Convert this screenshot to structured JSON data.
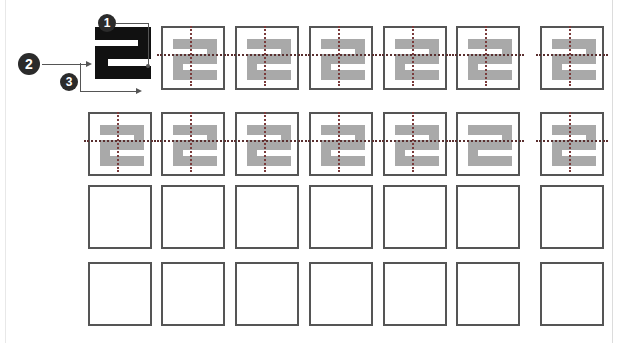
{
  "page": {
    "background_color": "#ffffff",
    "width": 624,
    "height": 343,
    "margin_rule_color": "#e8e8e8"
  },
  "style": {
    "cell_border_color": "#555555",
    "cell_border_width": 2,
    "cell_size": 64,
    "shape_grey": "#a9a9a9",
    "shape_black": "#111111",
    "axis_color": "#7a3b3b",
    "callout_fill": "#2b2b2b",
    "callout_text": "#ffffff",
    "leader_color": "#555555"
  },
  "callouts": [
    {
      "id": "callout-1",
      "label": "1",
      "x": 98,
      "y": 14,
      "diameter": 18,
      "target": "top-right of reference glyph"
    },
    {
      "id": "callout-2",
      "label": "2",
      "x": 18,
      "y": 53,
      "diameter": 22,
      "target": "left side of reference glyph"
    },
    {
      "id": "callout-3",
      "label": "3",
      "x": 60,
      "y": 73,
      "diameter": 18,
      "target": "bottom of reference glyph"
    }
  ],
  "reference_glyph": {
    "name": "reference-digit-2",
    "color": "#111111",
    "rotation_deg": 180,
    "x": 95,
    "y": 27,
    "width": 56,
    "height": 52
  },
  "grid": {
    "columns": 7,
    "rows": 4,
    "cell_width": 64,
    "cell_height": 64,
    "col_x": [
      88,
      161,
      235,
      309,
      383,
      456,
      540
    ],
    "row_y": [
      26,
      112,
      185,
      262
    ],
    "row_gap_note": "row 1 omits the first column (occupied by reference glyph)"
  },
  "rows": [
    {
      "index": 1,
      "name": "row-1",
      "cells": [
        {
          "col": 1,
          "filled": false,
          "note": "occupied by reference glyph and callouts"
        },
        {
          "col": 2,
          "filled": true,
          "shape": "digit-2-grey",
          "axis_vertical": true,
          "axis_horizontal": true
        },
        {
          "col": 3,
          "filled": true,
          "shape": "digit-2-grey",
          "axis_vertical": true,
          "axis_horizontal": true
        },
        {
          "col": 4,
          "filled": true,
          "shape": "digit-2-grey",
          "axis_vertical": true,
          "axis_horizontal": true
        },
        {
          "col": 5,
          "filled": true,
          "shape": "digit-2-grey",
          "axis_vertical": true,
          "axis_horizontal": true
        },
        {
          "col": 6,
          "filled": true,
          "shape": "digit-2-grey",
          "axis_vertical": true,
          "axis_horizontal": true
        },
        {
          "col": 7,
          "filled": true,
          "shape": "digit-2-grey",
          "axis_vertical": true,
          "axis_horizontal": true
        }
      ]
    },
    {
      "index": 2,
      "name": "row-2",
      "cells": [
        {
          "col": 1,
          "filled": true,
          "shape": "digit-2-grey",
          "axis_vertical": true,
          "axis_horizontal": true
        },
        {
          "col": 2,
          "filled": true,
          "shape": "digit-2-grey",
          "axis_vertical": true,
          "axis_horizontal": true
        },
        {
          "col": 3,
          "filled": true,
          "shape": "digit-2-grey",
          "axis_vertical": true,
          "axis_horizontal": true
        },
        {
          "col": 4,
          "filled": true,
          "shape": "digit-2-grey",
          "axis_vertical": true,
          "axis_horizontal": true
        },
        {
          "col": 5,
          "filled": true,
          "shape": "digit-2-grey",
          "axis_vertical": true,
          "axis_horizontal": true
        },
        {
          "col": 6,
          "filled": true,
          "shape": "digit-2-grey",
          "axis_vertical": false,
          "axis_horizontal": true
        },
        {
          "col": 7,
          "filled": true,
          "shape": "digit-2-grey",
          "axis_vertical": true,
          "axis_horizontal": true
        }
      ]
    },
    {
      "index": 3,
      "name": "row-3",
      "cells": [
        {
          "col": 1,
          "filled": false
        },
        {
          "col": 2,
          "filled": false
        },
        {
          "col": 3,
          "filled": false
        },
        {
          "col": 4,
          "filled": false
        },
        {
          "col": 5,
          "filled": false
        },
        {
          "col": 6,
          "filled": false
        },
        {
          "col": 7,
          "filled": false
        }
      ]
    },
    {
      "index": 4,
      "name": "row-4",
      "cells": [
        {
          "col": 1,
          "filled": false
        },
        {
          "col": 2,
          "filled": false
        },
        {
          "col": 3,
          "filled": false
        },
        {
          "col": 4,
          "filled": false
        },
        {
          "col": 5,
          "filled": false
        },
        {
          "col": 6,
          "filled": false
        },
        {
          "col": 7,
          "filled": false
        }
      ]
    }
  ]
}
